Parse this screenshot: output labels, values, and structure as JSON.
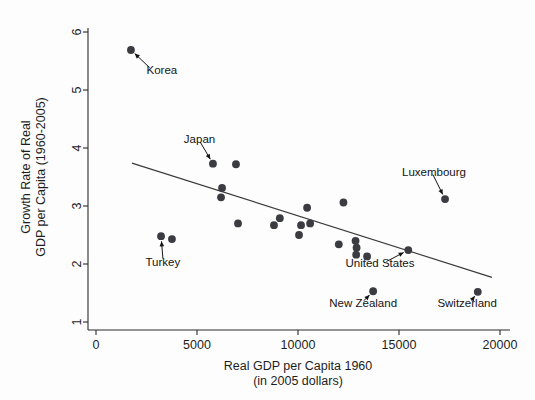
{
  "chart_data": {
    "type": "scatter",
    "title": "",
    "xlabel": "Real GDP per Capita 1960",
    "xlabel_line2": "(in 2005 dollars)",
    "ylabel_line1": "Growth Rate of Real",
    "ylabel_line2": "GDP per Capita (1960-2005)",
    "xlim": [
      0,
      20000
    ],
    "ylim": [
      1,
      6
    ],
    "xticks": [
      0,
      5000,
      10000,
      15000,
      20000
    ],
    "xticklabels": [
      "0",
      "5000",
      "10000",
      "15000",
      "20000"
    ],
    "yticks": [
      1,
      2,
      3,
      4,
      5,
      6
    ],
    "yticklabels": [
      "1",
      "2",
      "3",
      "4",
      "5",
      "6"
    ],
    "grid": false,
    "legend": "none",
    "marker_color": "#3b3b42",
    "line_color": "#3a3a3a",
    "axis_color": "#2b2b2b",
    "points": [
      {
        "x": 1730,
        "y": 5.69,
        "label": "Korea"
      },
      {
        "x": 3220,
        "y": 2.48,
        "label": "Turkey"
      },
      {
        "x": 3760,
        "y": 2.43,
        "label": ""
      },
      {
        "x": 5790,
        "y": 3.73,
        "label": "Japan"
      },
      {
        "x": 6240,
        "y": 3.31,
        "label": ""
      },
      {
        "x": 6190,
        "y": 3.15,
        "label": ""
      },
      {
        "x": 6930,
        "y": 3.72,
        "label": ""
      },
      {
        "x": 7030,
        "y": 2.7,
        "label": ""
      },
      {
        "x": 8810,
        "y": 2.67,
        "label": ""
      },
      {
        "x": 9100,
        "y": 2.79,
        "label": ""
      },
      {
        "x": 10050,
        "y": 2.5,
        "label": ""
      },
      {
        "x": 10150,
        "y": 2.67,
        "label": ""
      },
      {
        "x": 10450,
        "y": 2.97,
        "label": ""
      },
      {
        "x": 10600,
        "y": 2.7,
        "label": ""
      },
      {
        "x": 12020,
        "y": 2.34,
        "label": ""
      },
      {
        "x": 12250,
        "y": 3.06,
        "label": ""
      },
      {
        "x": 12850,
        "y": 2.4,
        "label": ""
      },
      {
        "x": 12900,
        "y": 2.28,
        "label": ""
      },
      {
        "x": 12880,
        "y": 2.16,
        "label": ""
      },
      {
        "x": 13420,
        "y": 2.13,
        "label": ""
      },
      {
        "x": 13720,
        "y": 1.53,
        "label": "New Zealand"
      },
      {
        "x": 15460,
        "y": 2.24,
        "label": "United States"
      },
      {
        "x": 17280,
        "y": 3.12,
        "label": "Luxembourg"
      },
      {
        "x": 18900,
        "y": 1.52,
        "label": "Switzerland"
      }
    ],
    "fit_line": {
      "x0": 1780,
      "y0": 3.74,
      "x1": 19600,
      "y1": 1.77
    },
    "annotations": [
      {
        "text": "Korea",
        "text_x": 2500,
        "text_y": 5.28,
        "point_x": 1730,
        "point_y": 5.69,
        "anchor": "start"
      },
      {
        "text": "Turkey",
        "text_x": 2450,
        "text_y": 1.97,
        "point_x": 3220,
        "point_y": 2.48,
        "anchor": "start"
      },
      {
        "text": "Japan",
        "text_x": 4350,
        "text_y": 4.08,
        "point_x": 5790,
        "point_y": 3.73,
        "anchor": "start"
      },
      {
        "text": "Luxembourg",
        "text_x": 15150,
        "text_y": 3.52,
        "point_x": 17280,
        "point_y": 3.12,
        "anchor": "start"
      },
      {
        "text": "United States",
        "text_x": 12350,
        "text_y": 1.95,
        "point_x": 15460,
        "point_y": 2.24,
        "anchor": "start"
      },
      {
        "text": "New Zealand",
        "text_x": 11550,
        "text_y": 1.26,
        "point_x": 13720,
        "point_y": 1.53,
        "anchor": "start"
      },
      {
        "text": "Switzerland",
        "text_x": 16900,
        "text_y": 1.26,
        "point_x": 18900,
        "point_y": 1.52,
        "anchor": "start"
      }
    ]
  }
}
